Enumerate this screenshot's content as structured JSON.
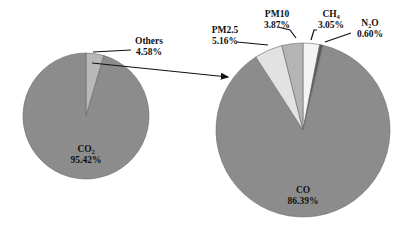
{
  "chart_data": [
    {
      "type": "pie",
      "title": "",
      "categories": [
        "CO2",
        "Others"
      ],
      "values": [
        95.42,
        4.58
      ],
      "labels": [
        {
          "main": "CO",
          "subscript": "2",
          "value": "95.42%"
        },
        {
          "main": "Others",
          "subscript": "",
          "value": "4.58%"
        }
      ],
      "colors": [
        "#8c8c8c",
        "#b8b8b8"
      ]
    },
    {
      "type": "pie",
      "title": "",
      "categories": [
        "CO",
        "PM2.5",
        "PM10",
        "CH4",
        "N2O"
      ],
      "values": [
        86.39,
        5.16,
        3.87,
        3.05,
        0.6
      ],
      "labels": [
        {
          "main": "CO",
          "subscript": "",
          "value": "86.39%"
        },
        {
          "main": "PM2.5",
          "subscript": "",
          "value": "5.16%"
        },
        {
          "main": "PM10",
          "subscript": "",
          "value": "3.87%"
        },
        {
          "main": "CH",
          "subscript": "4",
          "value": "3.05%"
        },
        {
          "main": "N",
          "subscript": "2",
          "suffix": "O",
          "value": "0.60%"
        }
      ],
      "colors": [
        "#8c8c8c",
        "#e2e2e2",
        "#b4b4b4",
        "#f4f4f4",
        "#5a5a5a"
      ]
    }
  ],
  "annotations": {
    "arrow": "Others slice expanded into breakdown pie"
  }
}
